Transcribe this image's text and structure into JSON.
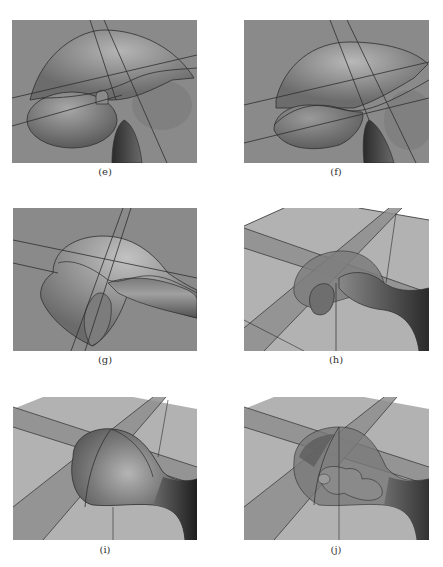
{
  "figure": {
    "panels": [
      {
        "id": "e",
        "caption": "(e)",
        "description": "Dome-shaped surface intersected by two slab planes, with ellipsoidal lobe and tube from below"
      },
      {
        "id": "f",
        "caption": "(f)",
        "description": "Dome surface merged with lower lobe, intersected by slab planes, tube from below"
      },
      {
        "id": "g",
        "caption": "(g)",
        "description": "Rounded body with attached elongated tube extending right, intersected by planes"
      },
      {
        "id": "h",
        "caption": "(h)",
        "description": "Perspective view with ground plane and bands; translucent dome over blob connected to tube"
      },
      {
        "id": "i",
        "caption": "(i)",
        "description": "Bulb-shaped surface with tube extending right over ground plane and crossing bands"
      },
      {
        "id": "j",
        "caption": "(j)",
        "description": "Translucent bulb revealing inner structure, tube extending right over ground plane"
      }
    ],
    "colors": {
      "background": "#8a8a8a",
      "surface": "#6e6e6e",
      "surface_highlight": "#b8b8b8",
      "line": "#2e2e2e",
      "plane_light": "#b2b2b2",
      "band": "#8e8e8e",
      "page": "#ffffff",
      "caption": "#333333"
    }
  }
}
